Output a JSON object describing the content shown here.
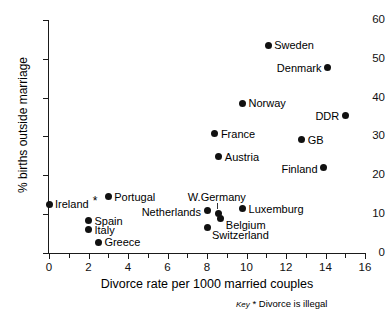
{
  "chart_data": {
    "type": "scatter",
    "title": "",
    "xlabel": "Divorce rate per 1000 married couples",
    "ylabel": "% births outside marriage",
    "xlim": [
      0,
      16
    ],
    "ylim": [
      0,
      60
    ],
    "xticks": [
      0,
      2,
      4,
      6,
      8,
      10,
      12,
      14,
      16
    ],
    "xticks_minor": [
      1,
      3,
      5,
      7,
      9,
      11,
      13,
      15
    ],
    "yticks": [
      0,
      10,
      20,
      30,
      40,
      50,
      60
    ],
    "grid": false,
    "legend": false,
    "points": [
      {
        "label": "Ireland",
        "x": 0.0,
        "y": 12.6,
        "label_pos": "right",
        "asterisk": true
      },
      {
        "label": "Portugal",
        "x": 3.0,
        "y": 14.5,
        "label_pos": "right"
      },
      {
        "label": "Spain",
        "x": 2.0,
        "y": 8.3,
        "label_pos": "right"
      },
      {
        "label": "Italy",
        "x": 2.0,
        "y": 6.0,
        "label_pos": "right"
      },
      {
        "label": "Greece",
        "x": 2.5,
        "y": 2.8,
        "label_pos": "right"
      },
      {
        "label": "Netherlands",
        "x": 8.0,
        "y": 10.9,
        "label_pos": "left"
      },
      {
        "label": "W.Germany",
        "x": 8.6,
        "y": 10.1,
        "label_pos": "above"
      },
      {
        "label": "Belgium",
        "x": 8.7,
        "y": 9.0,
        "label_pos": "right-below"
      },
      {
        "label": "Switzerland",
        "x": 8.0,
        "y": 6.5,
        "label_pos": "right-below"
      },
      {
        "label": "Luxemburg",
        "x": 9.8,
        "y": 11.4,
        "label_pos": "right"
      },
      {
        "label": "France",
        "x": 8.4,
        "y": 30.7,
        "label_pos": "right"
      },
      {
        "label": "Austria",
        "x": 8.6,
        "y": 24.8,
        "label_pos": "right"
      },
      {
        "label": "Norway",
        "x": 9.8,
        "y": 38.5,
        "label_pos": "right"
      },
      {
        "label": "Sweden",
        "x": 11.1,
        "y": 53.5,
        "label_pos": "right"
      },
      {
        "label": "Denmark",
        "x": 14.1,
        "y": 47.8,
        "label_pos": "left"
      },
      {
        "label": "DDR",
        "x": 15.0,
        "y": 35.4,
        "label_pos": "left"
      },
      {
        "label": "GB",
        "x": 12.8,
        "y": 29.2,
        "label_pos": "right"
      },
      {
        "label": "Finland",
        "x": 13.9,
        "y": 22.0,
        "label_pos": "left"
      }
    ]
  },
  "key": {
    "word": "Key",
    "symbol": "*",
    "text": "Divorce is illegal"
  }
}
